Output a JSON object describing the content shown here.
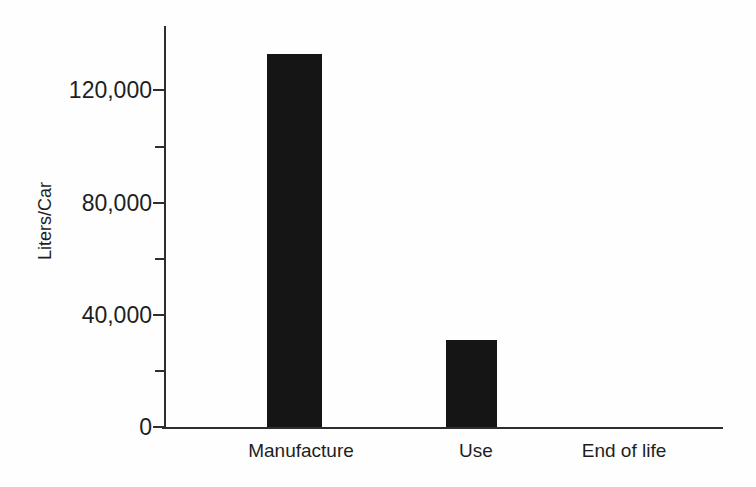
{
  "chart_data": {
    "type": "bar",
    "categories": [
      "Manufacture",
      "Use",
      "End of life"
    ],
    "values": [
      133000,
      31000,
      0
    ],
    "ylabel": "Liters/Car",
    "xlabel": "",
    "ylim": [
      0,
      143000
    ],
    "yticks": [
      {
        "value": 0,
        "label": "0"
      },
      {
        "value": 40000,
        "label": "40,000"
      },
      {
        "value": 80000,
        "label": "80,000"
      },
      {
        "value": 120000,
        "label": "120,000"
      }
    ],
    "minor_yticks": [
      20000,
      60000,
      100000
    ],
    "grid": false,
    "legend": false,
    "bar_color": "#151515",
    "axis_color": "#2e2e2e",
    "text_color": "#1e1e1e"
  }
}
